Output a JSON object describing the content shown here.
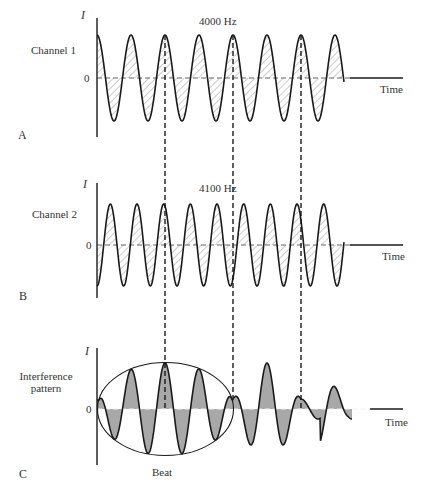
{
  "panels": [
    {
      "letter": "A",
      "channel_label": "Channel 1",
      "frequency_label": "4000 Hz",
      "y_axis_label": "I",
      "zero_label": "0",
      "x_axis_label": "Time"
    },
    {
      "letter": "B",
      "channel_label": "Channel 2",
      "frequency_label": "4100 Hz",
      "y_axis_label": "I",
      "zero_label": "0",
      "x_axis_label": "Time"
    },
    {
      "letter": "C",
      "channel_label_line1": "Interference",
      "channel_label_line2": "pattern",
      "y_axis_label": "I",
      "zero_label": "0",
      "x_axis_label": "Time",
      "envelope_label": "Beat"
    }
  ],
  "colors": {
    "stroke": "#1a1a1a",
    "hatch": "#9a9a9a",
    "fill_interference": "#a8a8a8",
    "dashed_zero": "#555555"
  },
  "waves": {
    "channel1": {
      "frequency_hz": 4000,
      "period_px": 34,
      "phase": "starts at peak"
    },
    "channel2": {
      "frequency_hz": 4100,
      "period_px": 26.7,
      "phase": "starts at trough"
    },
    "interference": {
      "envelope": "beat ellipse",
      "dashed_alignment_x": [
        165,
        233,
        301
      ]
    }
  }
}
